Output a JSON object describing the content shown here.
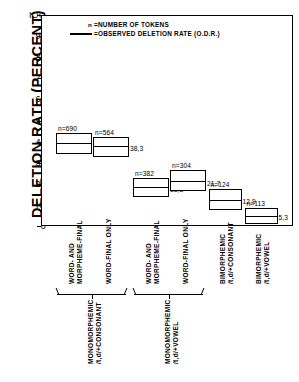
{
  "chart_data": {
    "type": "bar",
    "title": "",
    "xlabel": "",
    "ylabel": "DELETION RATE (PERCENT)",
    "ylim": [
      0,
      100
    ],
    "yticks": [
      0,
      10,
      20,
      30,
      40,
      50,
      60,
      70,
      80,
      90,
      100
    ],
    "ytick_labels": [
      "0",
      "IO",
      "20",
      "30",
      "40",
      "50",
      "60",
      "70",
      "80",
      "90",
      "IOO"
    ],
    "grid": false,
    "legend_position": "top-left",
    "legend": [
      {
        "symbol": "n",
        "symbol_type": "text",
        "label": "=NUMBER OF TOKENS"
      },
      {
        "symbol": "line",
        "symbol_type": "line",
        "label": "=OBSERVED DELETION RATE (O.D.R.)"
      }
    ],
    "categories": [
      "WORD- AND MORPHEME-FINAL",
      "WORD-FINAL ONLY",
      "WORD- AND MORPHEME-FINAL",
      "WORD-FINAL ONLY",
      "BIMORPHEMIC /t,d/+CONSONANT",
      "BIMORPHEMIC /t,d/+VOWEL"
    ],
    "values": [
      39.9,
      38.3,
      18.8,
      21.7,
      12.9,
      5.3
    ],
    "n_values": [
      690,
      564,
      382,
      304,
      124,
      113
    ],
    "series": [
      {
        "name": "Observed Deletion Rate (O.D.R.)",
        "values": [
          39.9,
          38.3,
          18.8,
          21.7,
          12.9,
          5.3
        ]
      },
      {
        "name": "Number of tokens (n)",
        "values": [
          690,
          564,
          382,
          304,
          124,
          113
        ]
      }
    ],
    "boxes": [
      {
        "n_label": "n=690",
        "value_label": "39,9",
        "value": 39.9,
        "box_top": 44.5,
        "box_bottom": 34.5
      },
      {
        "n_label": "n=564",
        "value_label": "38,3",
        "value": 38.3,
        "box_top": 42.5,
        "box_bottom": 33.0
      },
      {
        "n_label": "n=382",
        "value_label": "18,8",
        "value": 18.8,
        "box_top": 23.0,
        "box_bottom": 14.0
      },
      {
        "n_label": "n=304",
        "value_label": "21,7",
        "value": 21.7,
        "box_top": 27.0,
        "box_bottom": 17.0
      },
      {
        "n_label": "n=124",
        "value_label": "12,9",
        "value": 12.9,
        "box_top": 18.0,
        "box_bottom": 8.0
      },
      {
        "n_label": "n=113",
        "value_label": "5,3",
        "value": 5.3,
        "box_top": 9.0,
        "box_bottom": 1.5
      }
    ],
    "column_labels": [
      {
        "line1": "WORD- AND",
        "line2": "MORPHEME-FINAL"
      },
      {
        "line1": "WORD-FINAL ONLY",
        "line2": ""
      },
      {
        "line1": "WORD- AND",
        "line2": "MORPHEME-FINAL"
      },
      {
        "line1": "WORD-FINAL ONLY",
        "line2": ""
      },
      {
        "line1": "BIMORPHEMIC",
        "line2": "/t,d/+CONSONANT"
      },
      {
        "line1": "BIMORPHEMIC",
        "line2": "/t,d/+VOWEL"
      }
    ],
    "groups": [
      {
        "line1": "MONOMORPHEMIC",
        "line2": "/t,d/+CONSONANT",
        "covers": [
          0,
          1
        ]
      },
      {
        "line1": "MONOMORPHEMIC",
        "line2": "/t,d/+VOWEL",
        "covers": [
          2,
          3
        ]
      }
    ]
  }
}
